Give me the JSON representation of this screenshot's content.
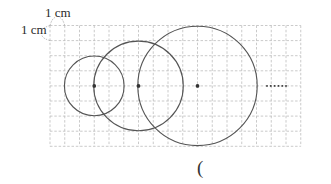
{
  "figure": {
    "unit_label_horizontal": "1 cm",
    "unit_label_vertical": "1 cm",
    "grid": {
      "columns": 17,
      "rows": 8,
      "cell_unit": "1 cm",
      "line_color": "#bdbdbd",
      "line_style": "dashed"
    },
    "circles": [
      {
        "name": "circle-1",
        "center_col": 3,
        "center_row": 4,
        "radius_cells": 2
      },
      {
        "name": "circle-2",
        "center_col": 6,
        "center_row": 4,
        "radius_cells": 3
      },
      {
        "name": "circle-3",
        "center_col": 10,
        "center_row": 4,
        "radius_cells": 4
      }
    ],
    "continuation_marker": "······",
    "stroke_color": "#555555",
    "center_dot_color": "#333333"
  },
  "answer": {
    "paren": "("
  }
}
